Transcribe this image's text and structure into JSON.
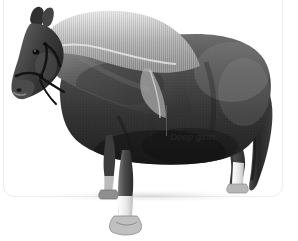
{
  "figure": {
    "kind": "photograph",
    "color_mode": "grayscale",
    "background_color": "#ffffff",
    "card": {
      "background_color": "#ffffff",
      "border_color": "#ededed",
      "corner_radius_px": 11
    }
  },
  "annotations": [
    {
      "label": "Deep girth",
      "style": "italic",
      "text_color": "#2b2b2b",
      "leader_line": {
        "orientation": "vertical",
        "color": "#585858",
        "target": "underside of barrel / girth area"
      }
    }
  ],
  "subject_features": {
    "mane": "long thick pale flowing mane over neck crest",
    "tail": "long dark tail reaching near the ground",
    "head_gear": "dark leather halter with noseband and cheekpiece",
    "markings": "white socks on near fore and hind legs",
    "body_tone": "dark grey / near-black coat",
    "hooves": "pale hooves, front hoof overflows below card edge"
  },
  "palette": {
    "coat_dark": "#2e2e2e",
    "coat_mid": "#585858",
    "coat_light": "#8f8f8f",
    "mane_light": "#cfcfcf",
    "mane_pale": "#e8e8e8",
    "sock_white": "#f2f2f2",
    "hoof": "#bdbdbd",
    "shadow": "#d8d8d8"
  }
}
